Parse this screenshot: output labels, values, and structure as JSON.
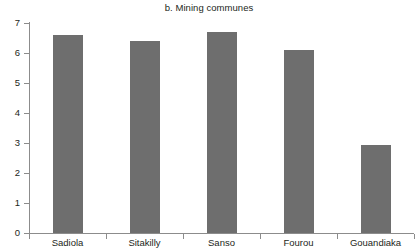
{
  "chart_data": {
    "type": "bar",
    "title": "b. Mining communes",
    "xlabel": "",
    "ylabel": "",
    "categories": [
      "Sadiola",
      "Sitakilly",
      "Sanso",
      "Fourou",
      "Gouandiaka"
    ],
    "values": [
      6.6,
      6.4,
      6.7,
      6.1,
      2.95
    ],
    "ylim": [
      0,
      7
    ],
    "yticks": [
      0,
      1,
      2,
      3,
      4,
      5,
      6,
      7
    ],
    "ytick_labels": [
      "0",
      "1",
      "2",
      "3",
      "4",
      "5",
      "6",
      "7"
    ],
    "grid": false,
    "legend": null,
    "bar_color": "#6e6e6e",
    "axis_color": "#8c8c8c",
    "background_color": "#ffffff",
    "text_color": "#231f20"
  }
}
